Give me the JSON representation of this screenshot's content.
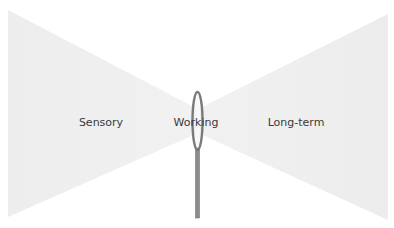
{
  "diagram": {
    "labels": {
      "sensory": "Sensory",
      "working": "Working",
      "long_term": "Long-term"
    },
    "colors": {
      "background": "#ffffff",
      "funnel_fill": "#ececec",
      "needle_stroke": "#7a7a7a",
      "needle_fill": "#8c8c8c",
      "label_text": "#3a3a3a"
    }
  }
}
